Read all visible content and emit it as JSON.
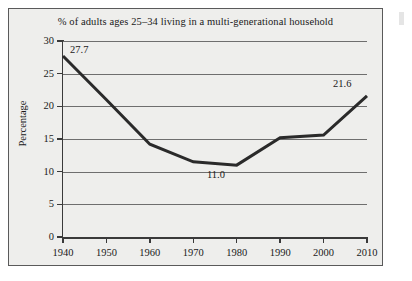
{
  "chart_data": {
    "type": "line",
    "title": "% of adults ages 25–34 living in a multi-generational household",
    "xlabel": "",
    "ylabel": "Percentage",
    "x": [
      1940,
      1950,
      1960,
      1970,
      1980,
      1990,
      2000,
      2010
    ],
    "categories": [
      "1940",
      "1950",
      "1960",
      "1970",
      "1980",
      "1990",
      "2000",
      "2010"
    ],
    "values": [
      27.7,
      21.0,
      14.2,
      11.5,
      11.0,
      15.2,
      15.6,
      21.6
    ],
    "series": [
      {
        "name": "% of adults ages 25-34 in multi-generational household",
        "values": [
          27.7,
          21.0,
          14.2,
          11.5,
          11.0,
          15.2,
          15.6,
          21.6
        ]
      }
    ],
    "xlim": [
      1940,
      2010
    ],
    "ylim": [
      0,
      30
    ],
    "yticks": [
      0,
      5,
      10,
      15,
      20,
      25,
      30
    ],
    "ytick_labels": [
      "0",
      "5",
      "10",
      "15",
      "20",
      "25",
      "30"
    ],
    "xticks": [
      1940,
      1950,
      1960,
      1970,
      1980,
      1990,
      2000,
      2010
    ],
    "xtick_labels": [
      "1940",
      "1950",
      "1960",
      "1970",
      "1980",
      "1990",
      "2000",
      "2010"
    ],
    "grid": "horizontal",
    "legend": "none",
    "point_labels": [
      {
        "x": 1940,
        "value": 27.7,
        "text": "27.7"
      },
      {
        "x": 1980,
        "value": 11.0,
        "text": "11.0"
      },
      {
        "x": 2010,
        "value": 21.6,
        "text": "21.6"
      }
    ],
    "colors": {
      "line": "#2a2a2a",
      "grid": "#6e6e6e",
      "axis": "#3a3a3a",
      "plot_background": "#eeeeec",
      "frame_border": "#5a5a5a",
      "text": "#1a1a1a"
    }
  }
}
